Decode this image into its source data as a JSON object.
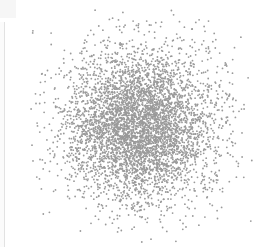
{
  "chart_data": {
    "type": "scatter",
    "title": "",
    "xlabel": "",
    "ylabel": "",
    "grid": false,
    "legend": null,
    "axes_visible": false,
    "point_color": "#9a9a9a",
    "point_radius": 0.9,
    "distribution": "2D Gaussian cluster",
    "center_px": [
      140,
      126
    ],
    "sigma_px": [
      38,
      38
    ],
    "n_points": 5000,
    "seed": 7,
    "extent_px": {
      "x": [
        30,
        252
      ],
      "y": [
        10,
        247
      ]
    }
  },
  "panel": {
    "left_edge_color": "#e2e2e2",
    "background": "#ffffff"
  }
}
